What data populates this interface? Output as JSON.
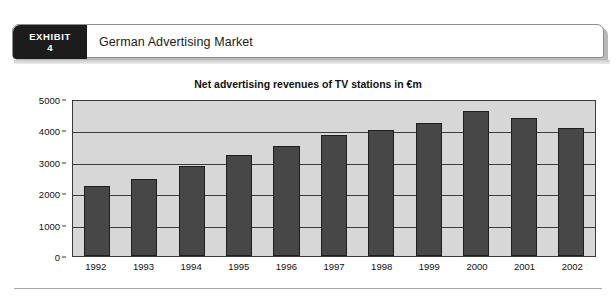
{
  "exhibit": {
    "label": "EXHIBIT",
    "number": "4",
    "title": "German Advertising Market"
  },
  "chart_data": {
    "type": "bar",
    "title": "Net advertising revenues of TV stations in €m",
    "xlabel": "",
    "ylabel": "",
    "categories": [
      "1992",
      "1993",
      "1994",
      "1995",
      "1996",
      "1997",
      "1998",
      "1999",
      "2000",
      "2001",
      "2002"
    ],
    "values": [
      2230,
      2450,
      2870,
      3230,
      3500,
      3840,
      4000,
      4250,
      4610,
      4380,
      4090
    ],
    "ylim": [
      0,
      5000
    ],
    "yticks": [
      0,
      1000,
      2000,
      3000,
      4000,
      5000
    ],
    "ytick_labels": [
      "0",
      "1000",
      "2000",
      "3000",
      "4000",
      "5000"
    ],
    "grid": true,
    "legend": false,
    "bar_color": "#474747",
    "plot_background": "#d7d7d7"
  }
}
